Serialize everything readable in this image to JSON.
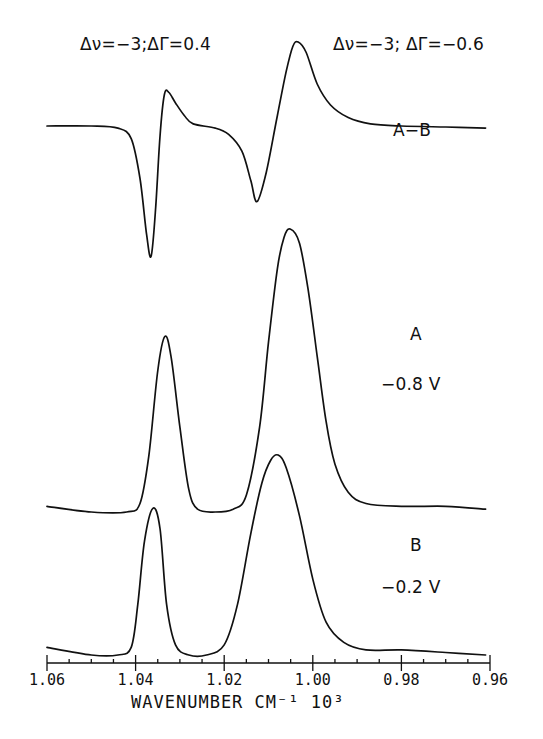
{
  "annotations": {
    "left_delta": "Δν=−3;ΔΓ=0.4",
    "right_delta": "Δν=−3; ΔΓ=−0.6",
    "ab_label": "A−B",
    "a_label": "A",
    "a_potential": "−0.8 V",
    "b_label": "B",
    "b_potential": "−0.2 V"
  },
  "axis": {
    "xlabel": "WAVENUMBER CM⁻¹ 10³",
    "tick_labels": [
      "1.06",
      "1.04",
      "1.02",
      "1.00",
      "0.98",
      "0.96"
    ]
  },
  "chart_data": {
    "type": "line",
    "title": "",
    "xlabel": "WAVENUMBER CM-1 10^3",
    "ylabel": "",
    "xlim": [
      1.06,
      0.96
    ],
    "x_reversed": true,
    "xticks": [
      1.06,
      1.04,
      1.02,
      1.0,
      0.98,
      0.96
    ],
    "minor_ticks_per_major": 4,
    "grid": false,
    "legend": "none (inline text labels)",
    "annotations": [
      {
        "text": "Δν=-3; ΔΓ=0.4",
        "near_x": 1.033
      },
      {
        "text": "Δν=-3; ΔΓ=-0.6",
        "near_x": 1.003
      },
      {
        "text": "A-B",
        "near_x": 0.985
      },
      {
        "text": "A  -0.8 V",
        "near_x": 0.985
      },
      {
        "text": "B  -0.2 V",
        "near_x": 0.985
      }
    ],
    "series": [
      {
        "name": "A-B (difference)",
        "baseline_px": 126,
        "units": "relative (offset trace, arbitrary intensity)",
        "features": [
          {
            "type": "negative lobe",
            "x": 1.0365,
            "rel_intensity": -0.62
          },
          {
            "type": "positive lobe",
            "x": 1.0325,
            "rel_intensity": 0.16
          },
          {
            "type": "negative lobe",
            "x": 1.0126,
            "rel_intensity": -0.36
          },
          {
            "type": "positive lobe",
            "x": 1.0033,
            "rel_intensity": 0.4
          }
        ],
        "points": [
          [
            1.06,
            0
          ],
          [
            1.05,
            0
          ],
          [
            1.044,
            -0.01
          ],
          [
            1.041,
            -0.06
          ],
          [
            1.039,
            -0.25
          ],
          [
            1.0375,
            -0.52
          ],
          [
            1.0365,
            -0.62
          ],
          [
            1.0355,
            -0.4
          ],
          [
            1.0345,
            -0.05
          ],
          [
            1.0335,
            0.15
          ],
          [
            1.0325,
            0.16
          ],
          [
            1.031,
            0.11
          ],
          [
            1.029,
            0.05
          ],
          [
            1.027,
            0.01
          ],
          [
            1.022,
            -0.01
          ],
          [
            1.019,
            -0.04
          ],
          [
            1.016,
            -0.12
          ],
          [
            1.014,
            -0.26
          ],
          [
            1.0126,
            -0.36
          ],
          [
            1.0105,
            -0.22
          ],
          [
            1.008,
            0.05
          ],
          [
            1.006,
            0.26
          ],
          [
            1.0045,
            0.38
          ],
          [
            1.0033,
            0.4
          ],
          [
            1.0015,
            0.35
          ],
          [
            0.999,
            0.2
          ],
          [
            0.996,
            0.1
          ],
          [
            0.992,
            0.04
          ],
          [
            0.987,
            0.01
          ],
          [
            0.98,
            0.0
          ],
          [
            0.97,
            -0.005
          ],
          [
            0.961,
            -0.01
          ]
        ]
      },
      {
        "name": "A (-0.8 V)",
        "baseline_px": 512,
        "units": "relative (offset trace, arbitrary intensity)",
        "features": [
          {
            "type": "peak",
            "x": 1.0334,
            "rel_intensity": 0.62
          },
          {
            "type": "peak",
            "x": 1.0051,
            "rel_intensity": 1.0
          }
        ],
        "points": [
          [
            1.06,
            0.02
          ],
          [
            1.05,
            0.0
          ],
          [
            1.042,
            0.0
          ],
          [
            1.039,
            0.03
          ],
          [
            1.037,
            0.2
          ],
          [
            1.035,
            0.5
          ],
          [
            1.0334,
            0.62
          ],
          [
            1.032,
            0.55
          ],
          [
            1.03,
            0.3
          ],
          [
            1.028,
            0.08
          ],
          [
            1.026,
            0.01
          ],
          [
            1.022,
            0.0
          ],
          [
            1.018,
            0.01
          ],
          [
            1.015,
            0.06
          ],
          [
            1.012,
            0.3
          ],
          [
            1.01,
            0.6
          ],
          [
            1.008,
            0.86
          ],
          [
            1.0065,
            0.97
          ],
          [
            1.0051,
            1.0
          ],
          [
            1.003,
            0.95
          ],
          [
            1.001,
            0.78
          ],
          [
            0.999,
            0.55
          ],
          [
            0.997,
            0.32
          ],
          [
            0.995,
            0.17
          ],
          [
            0.992,
            0.07
          ],
          [
            0.988,
            0.03
          ],
          [
            0.98,
            0.02
          ],
          [
            0.97,
            0.02
          ],
          [
            0.961,
            0.01
          ]
        ]
      },
      {
        "name": "B (-0.2 V)",
        "baseline_px": 655,
        "units": "relative (offset trace, arbitrary intensity)",
        "features": [
          {
            "type": "peak",
            "x": 1.0361,
            "rel_intensity": 0.58
          },
          {
            "type": "peak",
            "x": 1.0078,
            "rel_intensity": 0.79
          }
        ],
        "points": [
          [
            1.06,
            0.03
          ],
          [
            1.05,
            0.0
          ],
          [
            1.044,
            0.0
          ],
          [
            1.041,
            0.03
          ],
          [
            1.0395,
            0.2
          ],
          [
            1.038,
            0.45
          ],
          [
            1.0361,
            0.58
          ],
          [
            1.0345,
            0.5
          ],
          [
            1.033,
            0.2
          ],
          [
            1.031,
            0.04
          ],
          [
            1.028,
            0.0
          ],
          [
            1.024,
            0.0
          ],
          [
            1.02,
            0.04
          ],
          [
            1.017,
            0.2
          ],
          [
            1.014,
            0.48
          ],
          [
            1.0115,
            0.68
          ],
          [
            1.0095,
            0.77
          ],
          [
            1.0078,
            0.79
          ],
          [
            1.006,
            0.74
          ],
          [
            1.003,
            0.55
          ],
          [
            1.0,
            0.3
          ],
          [
            0.997,
            0.13
          ],
          [
            0.993,
            0.05
          ],
          [
            0.988,
            0.02
          ],
          [
            0.98,
            0.02
          ],
          [
            0.97,
            0.01
          ],
          [
            0.961,
            0.0
          ]
        ]
      }
    ]
  },
  "layout_px": {
    "x_left": 47,
    "x_right": 490,
    "axis_y": 663,
    "scale_px": {
      "A-B (difference)": 210,
      "A (-0.8 V)": 283,
      "B (-0.2 V)": 253
    }
  }
}
